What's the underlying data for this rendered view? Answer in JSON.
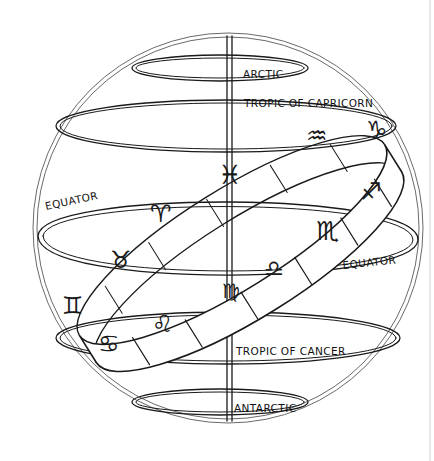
{
  "diagram": {
    "type": "armillary-sphere",
    "colors": {
      "ink": "#1a1a1a",
      "paper": "#ffffff"
    },
    "labels": {
      "arctic": "ARCTIC",
      "tropic_capricorn": "TROPIC OF CAPRICORN",
      "equator_left": "EQUATOR",
      "equator_right": "EQUATOR",
      "tropic_cancer": "TROPIC OF CANCER",
      "antarctic": "ANTARCTIC"
    },
    "zodiac": [
      {
        "name": "capricorn",
        "glyph": "♑"
      },
      {
        "name": "aquarius",
        "glyph": "♒"
      },
      {
        "name": "pisces",
        "glyph": "♓"
      },
      {
        "name": "aries",
        "glyph": "♈"
      },
      {
        "name": "taurus",
        "glyph": "♉"
      },
      {
        "name": "gemini",
        "glyph": "♊"
      },
      {
        "name": "cancer",
        "glyph": "♋"
      },
      {
        "name": "leo",
        "glyph": "♌"
      },
      {
        "name": "virgo",
        "glyph": "♍"
      },
      {
        "name": "libra",
        "glyph": "♎"
      },
      {
        "name": "scorpio",
        "glyph": "♏"
      },
      {
        "name": "sagittarius",
        "glyph": "♐"
      }
    ]
  }
}
